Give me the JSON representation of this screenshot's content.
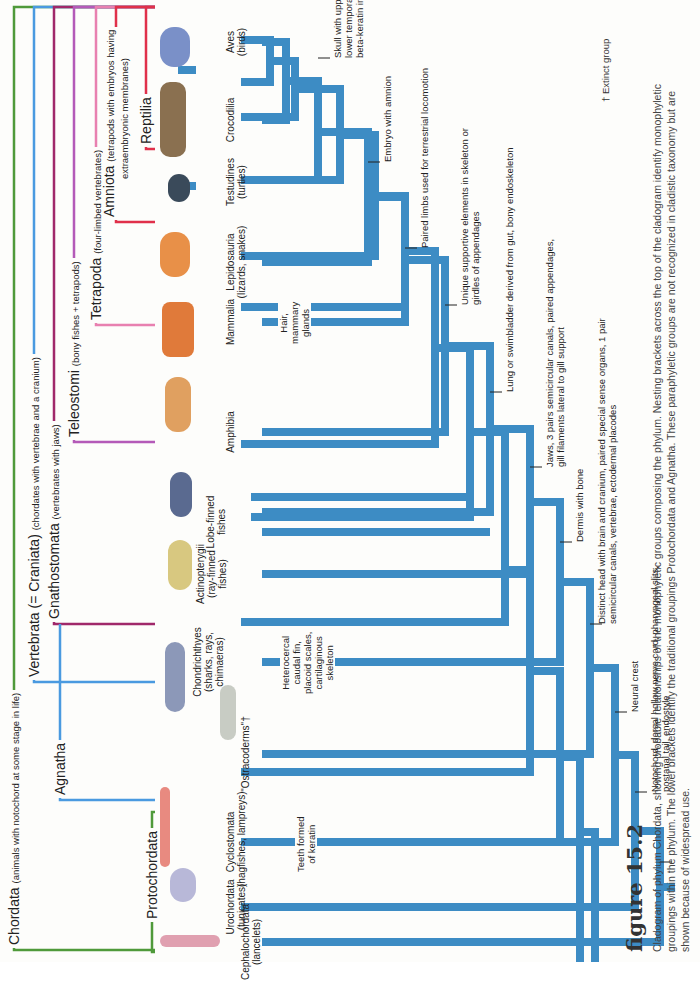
{
  "brackets": {
    "chordata": {
      "name": "Chordata",
      "desc": "(animals with notochord at some stage in life)",
      "color": "#4f9a3a"
    },
    "vertebrata": {
      "name": "Vertebrata (= Craniata)",
      "desc": "(chordates with vertebrae and a cranium)",
      "color": "#4a9ae0"
    },
    "gnathostomata": {
      "name": "Gnathostomata",
      "desc": "(vertebrates with jaws)",
      "color": "#a0286a"
    },
    "teleostomi": {
      "name": "Teleostomi",
      "desc": "(bony fishes + tetrapods)",
      "color": "#b45ab8"
    },
    "tetrapoda": {
      "name": "Tetrapoda",
      "desc": "(four-limbed vertebrates)",
      "color": "#e880b0"
    },
    "amniota": {
      "name": "Amniota",
      "desc": "(tetrapods with embryos having extraembryonic membranes)",
      "desc1": "(tetrapods with embryos having",
      "desc2": "extraembryonic membranes)",
      "color": "#e0304a"
    },
    "reptilia": {
      "name": "Reptilia",
      "color": "#e0304a"
    },
    "agnatha": {
      "name": "Agnatha",
      "color": "#4a9ae0"
    },
    "protochordata": {
      "name": "Protochordata",
      "color": "#4f9a3a"
    }
  },
  "taxa": [
    {
      "name": "Cephalochordata",
      "common": "(lancelets)"
    },
    {
      "name": "Urochordata",
      "common": "(tunicates)"
    },
    {
      "name": "Cyclostomata",
      "common": "(hagfishes, lampreys)"
    },
    {
      "name": "\"Ostracoderms\"†",
      "common": ""
    },
    {
      "name": "Chondrichthyes",
      "common": "(sharks, rays,",
      "common2": "chimaeras)"
    },
    {
      "name": "Actinopterygii",
      "common": "(ray-finned",
      "common2": "fishes)"
    },
    {
      "name": "Lobe-finned",
      "common": "fishes"
    },
    {
      "name": "Amphibia",
      "common": ""
    },
    {
      "name": "Mammalia",
      "common": ""
    },
    {
      "name": "Lepidosauria",
      "common": "(lizards, snakes)"
    },
    {
      "name": "Testudines",
      "common": "(turtles)"
    },
    {
      "name": "Crocodilia",
      "common": ""
    },
    {
      "name": "Aves",
      "common": "(birds)"
    }
  ],
  "characters": {
    "notochord": {
      "l1": "Notochord, dorsal hollow nerve cord, pharyngeal slits,",
      "l2": "postanal tail, endostyle"
    },
    "neural_crest": {
      "l1": "Neural crest"
    },
    "distinct_head": {
      "l1": "Distinct head with brain and cranium, paired special sense organs, 1 pair",
      "l2": "semicircular canals, vertebrae, ectodermal placodes"
    },
    "dermis": {
      "l1": "Dermis with bone"
    },
    "jaws": {
      "l1": "Jaws, 3 pairs semicircular canals, paired appendages,",
      "l2": "gill filaments lateral to gill support"
    },
    "lung": {
      "l1": "Lung or swimbladder derived from gut, bony endoskeleton"
    },
    "unique_supportive": {
      "l1": "Unique supportive elements in skeleton or",
      "l2": "girdles of appendages"
    },
    "paired_limbs": {
      "l1": "Paired limbs used for terrestrial locomotion"
    },
    "amnion": {
      "l1": "Embryo with amnion"
    },
    "skull": {
      "l1": "Skull with upper and",
      "l2": "lower temporal fenestra,",
      "l3": "beta-keratin in epidermis"
    },
    "teeth_keratin": {
      "l1": "Teeth formed",
      "l2": "of keratin"
    },
    "heterocercal": {
      "l1": "Heterocercal",
      "l2": "caudal fin,",
      "l3": "placoid scales,",
      "l4": "cartilaginous",
      "l5": "skeleton"
    },
    "hair": {
      "l1": "Hair,",
      "l2": "mammary",
      "l3": "glands"
    }
  },
  "legend": {
    "extinct": "† Extinct group"
  },
  "figure": {
    "title": "figure 15.2",
    "caption": "Cladogram of phylum Chordata, showing probable relationships of the monophyletic groups composing the phylum. Nesting brackets across the top of the cladogram identify monophyletic groupings within the phylum. The lower brackets identify the traditional groupings Protochordata and Agnatha. These paraphyletic groups are not recognized in cladistic taxonomy but are shown because of widespread use."
  },
  "colors": {
    "tree": "#3d8cc4",
    "background": "#fdfdfb"
  }
}
